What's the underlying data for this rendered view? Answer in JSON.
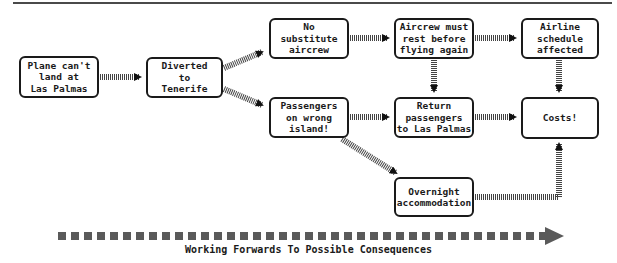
{
  "diagram": {
    "type": "flowchart",
    "nodes": [
      {
        "id": "n1",
        "label": "Plane can't\nland at\nLas Palmas"
      },
      {
        "id": "n2",
        "label": "Diverted\nto\nTenerife"
      },
      {
        "id": "n3",
        "label": "No\nsubstitute\naircrew"
      },
      {
        "id": "n4",
        "label": "Aircrew must\nrest before\nflying again"
      },
      {
        "id": "n5",
        "label": "Airline\nschedule\naffected"
      },
      {
        "id": "n6",
        "label": "Passengers\non wrong\nisland!"
      },
      {
        "id": "n7",
        "label": "Return\npassengers\nto Las Palmas"
      },
      {
        "id": "n8",
        "label": "Costs!"
      },
      {
        "id": "n9",
        "label": "Overnight\naccommodation"
      }
    ],
    "edges": [
      {
        "from": "n1",
        "to": "n2"
      },
      {
        "from": "n2",
        "to": "n3"
      },
      {
        "from": "n2",
        "to": "n6"
      },
      {
        "from": "n3",
        "to": "n4"
      },
      {
        "from": "n4",
        "to": "n5"
      },
      {
        "from": "n4",
        "to": "n7"
      },
      {
        "from": "n5",
        "to": "n8"
      },
      {
        "from": "n6",
        "to": "n7"
      },
      {
        "from": "n6",
        "to": "n9"
      },
      {
        "from": "n7",
        "to": "n8"
      },
      {
        "from": "n9",
        "to": "n8"
      }
    ],
    "caption": "Working Forwards To Possible Consequences",
    "colors": {
      "border": "#1a1a1a",
      "connector": "#3a3a3a",
      "timeline": "#5a5a5a"
    }
  }
}
